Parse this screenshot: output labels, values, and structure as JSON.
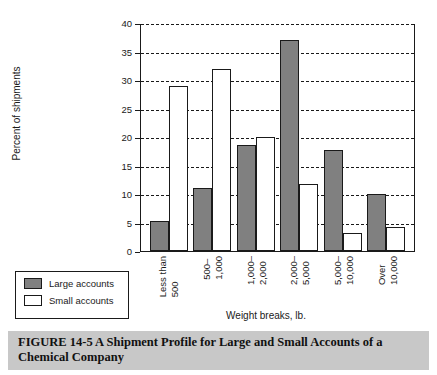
{
  "chart_data": {
    "type": "bar",
    "title": "",
    "xlabel": "Weight breaks, lb.",
    "ylabel": "Percent of shipments",
    "ylim": [
      0,
      40
    ],
    "ytick_step": 5,
    "yticks": [
      "0",
      "5",
      "10",
      "15",
      "20",
      "25",
      "30",
      "35",
      "40"
    ],
    "grid": "horizontal-dashed",
    "legend_position": "bottom-left-outside",
    "categories": [
      "Less than 500",
      "500– 1,000",
      "1,000– 2,000",
      "2,000– 5,000",
      "5,000– 10,000",
      "Over 10,000"
    ],
    "category_lines": [
      [
        "Less than",
        "500"
      ],
      [
        "500–",
        "1,000"
      ],
      [
        "1,000–",
        "2,000"
      ],
      [
        "2,000–",
        "5,000"
      ],
      [
        "5,000–",
        "10,000"
      ],
      [
        "Over",
        "10,000"
      ]
    ],
    "series": [
      {
        "name": "Large accounts",
        "color": "#808080",
        "values": [
          5.3,
          11,
          18.6,
          37,
          17.8,
          10
        ]
      },
      {
        "name": "Small accounts",
        "color": "#ffffff",
        "values": [
          29,
          32,
          20,
          11.8,
          3.1,
          4.3
        ]
      }
    ]
  },
  "legend": {
    "items": [
      {
        "label": "Large accounts",
        "color": "#808080"
      },
      {
        "label": "Small accounts",
        "color": "#ffffff"
      }
    ]
  },
  "caption": {
    "text": "FIGURE 14-5  A Shipment Profile for Large and Small Accounts of a Chemical Company",
    "band_color": "#c8c8c8"
  },
  "colors": {
    "large_accounts": "#808080",
    "small_accounts": "#ffffff",
    "axis": "#1a1a1a",
    "background": "#ffffff"
  }
}
